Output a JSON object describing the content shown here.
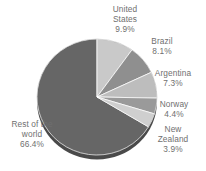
{
  "chart_data": {
    "type": "pie",
    "title": "",
    "subtitle": "",
    "xlabel": "",
    "ylabel": "",
    "legend_position": "none",
    "grid": false,
    "labels_show_percent": true,
    "start_angle_deg": 0,
    "direction": "clockwise",
    "categories": [
      "United States",
      "Brazil",
      "Argentina",
      "Norway",
      "New Zealand",
      "Rest of the world"
    ],
    "values": [
      9.9,
      8.1,
      7.3,
      4.4,
      3.9,
      66.4
    ],
    "value_labels": [
      "9.9%",
      "8.1%",
      "7.3%",
      "4.4%",
      "3.9%",
      "66.4%"
    ],
    "colors": [
      "#c9c9c9",
      "#8f8f8f",
      "#bdbdbd",
      "#9a9a9a",
      "#cfcfcf",
      "#666666"
    ],
    "slices": [
      {
        "name": "United States",
        "name_line1": "United",
        "name_line2": "States",
        "value": 9.9,
        "value_label": "9.9%",
        "color": "#c9c9c9"
      },
      {
        "name": "Brazil",
        "name_line1": "Brazil",
        "name_line2": "",
        "value": 8.1,
        "value_label": "8.1%",
        "color": "#8f8f8f"
      },
      {
        "name": "Argentina",
        "name_line1": "Argentina",
        "name_line2": "",
        "value": 7.3,
        "value_label": "7.3%",
        "color": "#bdbdbd"
      },
      {
        "name": "Norway",
        "name_line1": "Norway",
        "name_line2": "",
        "value": 4.4,
        "value_label": "4.4%",
        "color": "#9a9a9a"
      },
      {
        "name": "New Zealand",
        "name_line1": "New",
        "name_line2": "Zealand",
        "value": 3.9,
        "value_label": "3.9%",
        "color": "#cfcfcf"
      },
      {
        "name": "Rest of the world",
        "name_line1": "Rest of the",
        "name_line2": "world",
        "value": 66.4,
        "value_label": "66.4%",
        "color": "#666666"
      }
    ]
  },
  "style": {
    "background": "#ffffff",
    "label_color": "#6f6f6f",
    "edge_color": "#ffffff",
    "depth_color": "#4f4f4f"
  }
}
